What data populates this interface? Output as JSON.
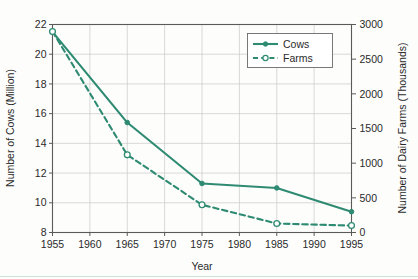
{
  "chart_data": {
    "type": "line",
    "title": "",
    "xlabel": "Year",
    "ylabel": "Number of Cows (Million)",
    "y2label": "Number of Dairy Farms (Thousands)",
    "grid": true,
    "legend_position": "top-right",
    "x": [
      1955,
      1965,
      1975,
      1985,
      1995
    ],
    "xlim": [
      1955,
      1995
    ],
    "xticks": [
      1955,
      1960,
      1965,
      1970,
      1975,
      1980,
      1985,
      1990,
      1995
    ],
    "xtick_labels": [
      "1955",
      "1960",
      "1965",
      "1970",
      "1975",
      "1980",
      "1985",
      "1990",
      "1995"
    ],
    "ylim": [
      8,
      22
    ],
    "yticks": [
      8,
      10,
      12,
      14,
      16,
      18,
      20,
      22
    ],
    "ytick_labels": [
      "8",
      "10",
      "12",
      "14",
      "16",
      "18",
      "20",
      "22"
    ],
    "y2lim": [
      0,
      3000
    ],
    "y2ticks": [
      0,
      500,
      1000,
      1500,
      2000,
      2500,
      3000
    ],
    "y2tick_labels": [
      "0",
      "500",
      "1000",
      "1500",
      "2000",
      "2500",
      "3000"
    ],
    "series": [
      {
        "name": "Cows",
        "axis": "left",
        "units": "Million",
        "style": "solid",
        "marker": "filled-circle",
        "color": "#2E8B72",
        "values": [
          21.5,
          15.4,
          11.3,
          11.0,
          9.4
        ]
      },
      {
        "name": "Farms",
        "axis": "right",
        "units": "Thousands",
        "style": "dashed",
        "marker": "open-circle",
        "color": "#2E8B72",
        "values": [
          2900,
          1120,
          400,
          130,
          100
        ]
      }
    ]
  },
  "legend": {
    "entries": [
      {
        "label": "Cows"
      },
      {
        "label": "Farms"
      }
    ]
  },
  "colors": {
    "series": "#2E8B72",
    "grid": "#c9c9c9",
    "frame": "#5a5a5a",
    "text": "#2a2a2a",
    "background": "#fdfdfc"
  }
}
